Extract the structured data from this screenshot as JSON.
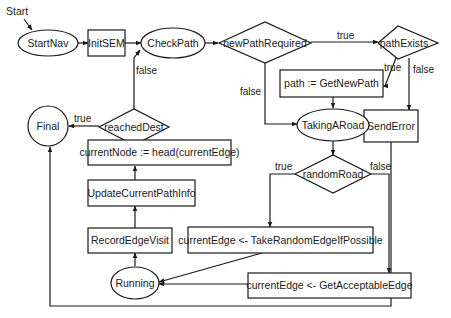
{
  "diagram": {
    "type": "flowchart",
    "start_label": "Start",
    "nodes": {
      "start_nav": "StartNav",
      "init_sem": "InitSEM",
      "check_path": "CheckPath",
      "new_path_required": "newPathRequired",
      "path_exists": "pathExists",
      "get_new_path": "path := GetNewPath",
      "send_error": "SendError",
      "taking_a_road": "TakingARoad",
      "random_road": "randomRoad",
      "reached_dest": "reachedDest",
      "final": "Final",
      "current_node": "currentNode := head(currentEdge)",
      "update_path_info": "UpdateCurrentPathInfo",
      "record_edge_visit": "RecordEdgeVisit",
      "running": "Running",
      "take_random_edge": "currentEdge <- TakeRandomEdgeIfPossible",
      "get_acceptable_edge": "currentEdge <- GetAcceptableEdge"
    },
    "edge_labels": {
      "npr_true": "true",
      "npr_false": "false",
      "pe_true": "true",
      "pe_false": "false",
      "rr_true": "true",
      "rr_false": "false",
      "rd_true": "true",
      "rd_false": "false"
    },
    "edges": [
      {
        "from": "Start",
        "to": "StartNav"
      },
      {
        "from": "StartNav",
        "to": "InitSEM"
      },
      {
        "from": "InitSEM",
        "to": "CheckPath"
      },
      {
        "from": "CheckPath",
        "to": "newPathRequired"
      },
      {
        "from": "newPathRequired",
        "to": "pathExists",
        "label": "true"
      },
      {
        "from": "newPathRequired",
        "to": "TakingARoad",
        "label": "false"
      },
      {
        "from": "pathExists",
        "to": "path := GetNewPath",
        "label": "true"
      },
      {
        "from": "pathExists",
        "to": "SendError",
        "label": "false"
      },
      {
        "from": "path := GetNewPath",
        "to": "TakingARoad"
      },
      {
        "from": "TakingARoad",
        "to": "randomRoad"
      },
      {
        "from": "randomRoad",
        "to": "currentEdge <- TakeRandomEdgeIfPossible",
        "label": "true"
      },
      {
        "from": "randomRoad",
        "to": "currentEdge <- GetAcceptableEdge",
        "label": "false"
      },
      {
        "from": "currentEdge <- TakeRandomEdgeIfPossible",
        "to": "Running"
      },
      {
        "from": "currentEdge <- GetAcceptableEdge",
        "to": "Running"
      },
      {
        "from": "Running",
        "to": "RecordEdgeVisit"
      },
      {
        "from": "RecordEdgeVisit",
        "to": "UpdateCurrentPathInfo"
      },
      {
        "from": "UpdateCurrentPathInfo",
        "to": "currentNode := head(currentEdge)"
      },
      {
        "from": "currentNode := head(currentEdge)",
        "to": "reachedDest"
      },
      {
        "from": "reachedDest",
        "to": "Final",
        "label": "true"
      },
      {
        "from": "reachedDest",
        "to": "CheckPath",
        "label": "false"
      },
      {
        "from": "SendError",
        "to": "Final"
      }
    ]
  }
}
